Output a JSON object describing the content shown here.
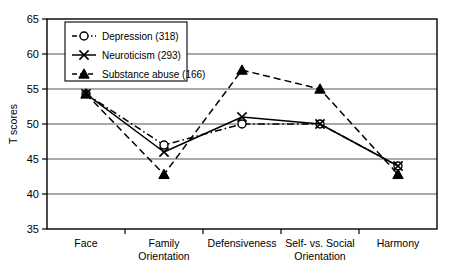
{
  "chart_data": {
    "type": "line",
    "title": "",
    "xlabel": "",
    "ylabel": "T scores",
    "ylim": [
      35,
      65
    ],
    "yticks": [
      35,
      40,
      45,
      50,
      55,
      60,
      65
    ],
    "grid": "horizontal",
    "legend_position": "top-left-inside",
    "categories": [
      "Face",
      "Family Orientation",
      "Defensiveness",
      "Self- vs. Social Orientation",
      "Harmony"
    ],
    "category_lines": [
      [
        "Face",
        ""
      ],
      [
        "Family",
        "Orientation"
      ],
      [
        "Defensiveness",
        ""
      ],
      [
        "Self- vs. Social",
        "Orientation"
      ],
      [
        "Harmony",
        ""
      ]
    ],
    "series": [
      {
        "name": "Depression (318)",
        "marker": "open-circle",
        "line_style": "dash-dot",
        "values": [
          54.3,
          47.0,
          50.0,
          50.0,
          44.0
        ]
      },
      {
        "name": "Neuroticism (293)",
        "marker": "x-cross",
        "line_style": "solid",
        "values": [
          54.3,
          46.0,
          51.0,
          50.0,
          44.0
        ]
      },
      {
        "name": "Substance abuse (166)",
        "marker": "filled-triangle",
        "line_style": "dashed",
        "values": [
          54.3,
          42.8,
          57.7,
          55.0,
          42.8
        ]
      }
    ]
  },
  "colors": {
    "line": "#000000",
    "grid": "#555555",
    "axis": "#000000",
    "background": "#ffffff"
  }
}
